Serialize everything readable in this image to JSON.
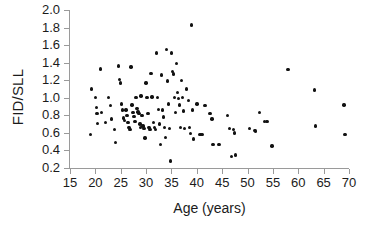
{
  "chart_data": {
    "type": "scatter",
    "title": "",
    "xlabel": "Age (years)",
    "ylabel": "FID/SLL",
    "xlim": [
      15,
      70
    ],
    "ylim": [
      0.2,
      2.0
    ],
    "xticks": [
      15,
      20,
      25,
      30,
      35,
      40,
      45,
      50,
      55,
      60,
      65,
      70
    ],
    "xtick_labels": [
      "15",
      "20",
      "25",
      "30",
      "35",
      "40",
      "45",
      "50",
      "55",
      "60",
      "65",
      "70"
    ],
    "yticks": [
      0.2,
      0.4,
      0.6,
      0.8,
      1.0,
      1.2,
      1.4,
      1.6,
      1.8,
      2.0
    ],
    "ytick_labels": [
      "0.2",
      "0.4",
      "0.6",
      "0.8",
      "1.0",
      "1.2",
      "1.4",
      "1.6",
      "1.8",
      "2.0"
    ],
    "grid": false,
    "legend": false,
    "marker": "filled-circle",
    "marker_color": "#111111",
    "axis_color": "#9a9a9a",
    "background": "#ffffff",
    "points": [
      [
        19.0,
        0.58
      ],
      [
        19.2,
        1.1
      ],
      [
        20.0,
        1.0
      ],
      [
        20.2,
        0.89
      ],
      [
        20.3,
        0.82
      ],
      [
        20.4,
        0.71
      ],
      [
        21.0,
        1.33
      ],
      [
        21.2,
        0.83
      ],
      [
        22.0,
        0.72
      ],
      [
        22.6,
        1.0
      ],
      [
        23.0,
        0.91
      ],
      [
        23.2,
        0.76
      ],
      [
        23.8,
        0.64
      ],
      [
        24.0,
        0.49
      ],
      [
        24.6,
        1.36
      ],
      [
        24.8,
        1.21
      ],
      [
        25.0,
        1.17
      ],
      [
        25.2,
        0.93
      ],
      [
        25.4,
        0.86
      ],
      [
        25.6,
        0.77
      ],
      [
        25.8,
        0.74
      ],
      [
        26.0,
        0.86
      ],
      [
        26.2,
        0.8
      ],
      [
        26.4,
        0.72
      ],
      [
        26.6,
        0.66
      ],
      [
        26.8,
        0.64
      ],
      [
        27.0,
        1.35
      ],
      [
        27.2,
        0.92
      ],
      [
        27.4,
        0.83
      ],
      [
        27.6,
        0.79
      ],
      [
        27.8,
        0.73
      ],
      [
        28.0,
        1.0
      ],
      [
        28.2,
        0.88
      ],
      [
        28.4,
        0.84
      ],
      [
        28.6,
        0.82
      ],
      [
        28.8,
        0.7
      ],
      [
        28.9,
        0.66
      ],
      [
        29.0,
        1.02
      ],
      [
        29.2,
        0.8
      ],
      [
        29.4,
        0.68
      ],
      [
        29.6,
        0.65
      ],
      [
        29.8,
        0.54
      ],
      [
        30.0,
        1.17
      ],
      [
        30.2,
        1.0
      ],
      [
        30.4,
        0.82
      ],
      [
        30.6,
        0.66
      ],
      [
        30.8,
        0.64
      ],
      [
        31.0,
        1.28
      ],
      [
        31.2,
        1.01
      ],
      [
        31.4,
        0.72
      ],
      [
        31.6,
        0.66
      ],
      [
        31.8,
        0.64
      ],
      [
        32.0,
        1.51
      ],
      [
        32.2,
        1.0
      ],
      [
        32.4,
        0.87
      ],
      [
        32.6,
        0.7
      ],
      [
        32.8,
        0.47
      ],
      [
        33.0,
        1.26
      ],
      [
        33.2,
        0.86
      ],
      [
        33.4,
        0.78
      ],
      [
        33.6,
        0.66
      ],
      [
        33.8,
        0.55
      ],
      [
        34.0,
        1.55
      ],
      [
        34.2,
        1.19
      ],
      [
        34.4,
        0.93
      ],
      [
        34.6,
        0.65
      ],
      [
        34.8,
        0.28
      ],
      [
        35.0,
        1.51
      ],
      [
        35.2,
        1.3
      ],
      [
        35.4,
        1.27
      ],
      [
        35.6,
        1.0
      ],
      [
        35.8,
        0.83
      ],
      [
        36.0,
        1.39
      ],
      [
        36.2,
        1.06
      ],
      [
        36.4,
        0.99
      ],
      [
        36.6,
        0.92
      ],
      [
        36.8,
        0.66
      ],
      [
        37.0,
        1.2
      ],
      [
        37.2,
        1.0
      ],
      [
        37.4,
        0.85
      ],
      [
        37.6,
        0.65
      ],
      [
        38.0,
        1.1
      ],
      [
        38.4,
        0.97
      ],
      [
        38.6,
        0.66
      ],
      [
        38.8,
        0.59
      ],
      [
        39.0,
        1.83
      ],
      [
        39.2,
        0.86
      ],
      [
        39.4,
        0.53
      ],
      [
        40.0,
        0.93
      ],
      [
        40.6,
        0.58
      ],
      [
        41.0,
        0.58
      ],
      [
        41.6,
        0.91
      ],
      [
        42.6,
        0.82
      ],
      [
        43.0,
        0.76
      ],
      [
        43.2,
        0.47
      ],
      [
        44.4,
        0.47
      ],
      [
        46.0,
        0.8
      ],
      [
        46.4,
        0.65
      ],
      [
        46.8,
        0.33
      ],
      [
        47.2,
        0.64
      ],
      [
        47.4,
        0.6
      ],
      [
        47.6,
        0.35
      ],
      [
        50.4,
        0.65
      ],
      [
        51.4,
        0.63
      ],
      [
        51.6,
        0.62
      ],
      [
        52.4,
        0.83
      ],
      [
        53.4,
        0.73
      ],
      [
        53.8,
        0.73
      ],
      [
        54.8,
        0.45
      ],
      [
        58.0,
        1.32
      ],
      [
        63.2,
        1.09
      ],
      [
        63.4,
        0.68
      ],
      [
        69.0,
        0.92
      ],
      [
        69.2,
        0.58
      ]
    ]
  }
}
